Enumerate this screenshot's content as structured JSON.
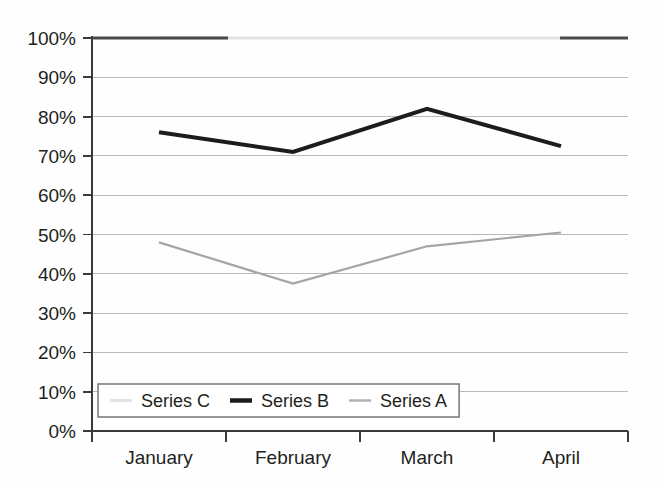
{
  "chart_data": {
    "type": "line",
    "title": "",
    "subtitle": "",
    "xlabel": "",
    "ylabel": "",
    "categories": [
      "January",
      "February",
      "March",
      "April"
    ],
    "ylim": [
      0,
      100
    ],
    "yticks": [
      0,
      10,
      20,
      30,
      40,
      50,
      60,
      70,
      80,
      90,
      100
    ],
    "ytick_labels": [
      "0%",
      "10%",
      "20%",
      "30%",
      "40%",
      "50%",
      "60%",
      "70%",
      "80%",
      "90%",
      "100%"
    ],
    "grid": "horizontal",
    "legend_position": "inside-bottom-left",
    "series": [
      {
        "name": "Series C",
        "values": [
          100,
          100,
          100,
          100
        ],
        "color": "#e3e3e3",
        "width": 3.2
      },
      {
        "name": "Series B",
        "values": [
          76,
          71,
          82,
          72.5
        ],
        "color": "#1c1c1c",
        "width": 4.0
      },
      {
        "name": "Series A",
        "values": [
          48,
          37.5,
          47,
          50.5
        ],
        "color": "#a5a5a5",
        "width": 2.2
      }
    ],
    "legend_entries": [
      {
        "label": "Series C",
        "color": "#e3e3e3",
        "width": 3.2
      },
      {
        "label": "Series B",
        "color": "#1c1c1c",
        "width": 4.5
      },
      {
        "label": "Series A",
        "color": "#b0b0b0",
        "width": 2.4
      }
    ],
    "axis_color": "#3a3a3a",
    "gridline_color": "#b9b9b9",
    "background_color": "#fefefe"
  }
}
